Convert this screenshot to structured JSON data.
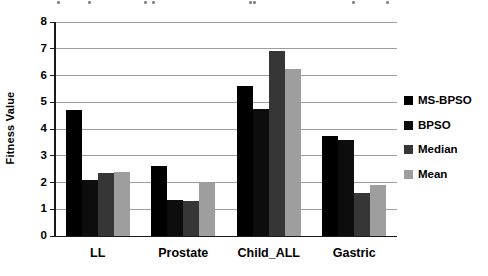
{
  "chart_data": {
    "type": "bar",
    "title": "",
    "xlabel": "",
    "ylabel": "Fitness Value",
    "ylim": [
      0,
      8
    ],
    "ytick_step": 1,
    "ytick_labels": [
      "0",
      "1",
      "2",
      "3",
      "4",
      "5",
      "6",
      "7",
      "8"
    ],
    "grid": true,
    "legend_position": "right",
    "categories": [
      "LL",
      "Prostate",
      "Child_ALL",
      "Gastric"
    ],
    "series": [
      {
        "name": "MS-BPSO",
        "color": "#000000",
        "values": [
          4.7,
          2.6,
          5.6,
          3.75
        ]
      },
      {
        "name": "BPSO",
        "color": "#0d0d0d",
        "values": [
          2.1,
          1.35,
          4.75,
          3.6
        ]
      },
      {
        "name": "Median",
        "color": "#363636",
        "values": [
          2.35,
          1.3,
          6.9,
          1.6
        ]
      },
      {
        "name": "Mean",
        "color": "#9e9e9e",
        "values": [
          2.4,
          2.0,
          6.25,
          1.9
        ]
      }
    ],
    "colors": {
      "gridline": "#9d9d9d",
      "axis": "#1a1a1a",
      "text": "#000000",
      "background": "#ffffff"
    }
  },
  "top_fragments": {
    "x_positions": [
      57,
      88,
      144,
      152,
      249,
      253,
      352,
      386
    ]
  }
}
